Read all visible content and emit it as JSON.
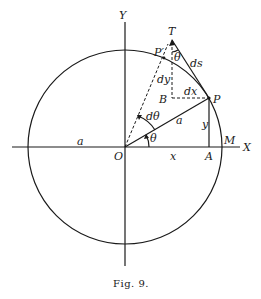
{
  "figure": {
    "caption": "Fig. 9.",
    "labels": {
      "y_axis": "Y",
      "x_axis": "X",
      "origin": "O",
      "point_T": "T",
      "point_P_prime": "P′",
      "point_P": "P",
      "point_B": "B",
      "point_A": "A",
      "point_M": "M",
      "theta_at_T": "θ",
      "ds": "ds",
      "dy": "dy",
      "dx": "dx",
      "d_theta": "dθ",
      "radius_a_inner": "a",
      "radius_a_left": "a",
      "y_ordinate": "y",
      "theta_at_O": "θ",
      "x_abscissa": "x"
    },
    "colors": {
      "ink": "#1a1a1a",
      "background": "#ffffff"
    }
  }
}
